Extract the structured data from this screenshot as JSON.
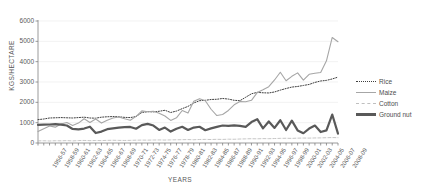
{
  "chart_data": {
    "type": "line",
    "title": "",
    "xlabel": "YEARS",
    "ylabel": "KGS/HECTARE",
    "ylim": [
      0,
      6000
    ],
    "yticks": [
      0,
      1000,
      2000,
      3000,
      4000,
      5000,
      6000
    ],
    "grid": true,
    "legend_position": "right",
    "x": [
      "1956-57",
      "1957-58",
      "1958-59",
      "1959-60",
      "1960-61",
      "1961-62",
      "1962-63",
      "1963-64",
      "1964-65",
      "1965-66",
      "1966-67",
      "1967-68",
      "1968-69",
      "1969-70",
      "1970-71",
      "1971-72",
      "1972-73",
      "1973-74",
      "1974-75",
      "1975-76",
      "1976-77",
      "1977-78",
      "1978-79",
      "1979-80",
      "1980-81",
      "1981-82",
      "1982-83",
      "1983-84",
      "1984-85",
      "1985-86",
      "1986-87",
      "1987-88",
      "1988-89",
      "1989-90",
      "1990-91",
      "1991-92",
      "1992-93",
      "1993-94",
      "1994-95",
      "1995-96",
      "1996-97",
      "1997-98",
      "1998-99",
      "1999-00",
      "2000-01",
      "2001-02",
      "2002-03",
      "2003-04",
      "2004-05",
      "2005-06",
      "2006-07",
      "2007-08",
      "2008-09"
    ],
    "xtick_labels": [
      "1956-57",
      "1958-59",
      "1960-61",
      "1962-63",
      "1964-65",
      "1966-67",
      "1968-69",
      "1970-71",
      "1972-73",
      "1974-75",
      "1976-77",
      "1978-79",
      "1980-81",
      "1982-83",
      "1984-85",
      "1986-87",
      "1988-89",
      "1990-91",
      "1992-93",
      "1994-95",
      "1996-97",
      "1998-99",
      "2000-01",
      "2002-03",
      "2004-05",
      "2006-07",
      "2008-09"
    ],
    "series": [
      {
        "name": "Rice",
        "style": "dotted",
        "color": "#3f3f3f",
        "width": 1,
        "values": [
          1150,
          1180,
          1230,
          1240,
          1250,
          1240,
          1230,
          1250,
          1270,
          1230,
          1220,
          1270,
          1290,
          1300,
          1290,
          1260,
          1250,
          1300,
          1500,
          1540,
          1530,
          1560,
          1610,
          1500,
          1570,
          1690,
          1800,
          1970,
          2080,
          2100,
          2140,
          2150,
          2190,
          2160,
          2100,
          2080,
          2250,
          2420,
          2490,
          2470,
          2460,
          2510,
          2600,
          2680,
          2750,
          2780,
          2830,
          2880,
          2980,
          3050,
          3080,
          3150,
          3240
        ]
      },
      {
        "name": "Maize",
        "style": "solid",
        "color": "#a6a6a6",
        "width": 1.1,
        "values": [
          560,
          700,
          840,
          780,
          930,
          1010,
          860,
          980,
          1190,
          1010,
          1180,
          980,
          1120,
          1230,
          1280,
          1190,
          1120,
          1310,
          1580,
          1540,
          1560,
          1460,
          1330,
          1110,
          1240,
          1600,
          1470,
          2050,
          2180,
          2080,
          1660,
          1350,
          1400,
          1600,
          1880,
          2040,
          2030,
          2100,
          2480,
          2620,
          2770,
          3100,
          3480,
          3060,
          3280,
          3450,
          3090,
          3380,
          3430,
          3470,
          4040,
          5190,
          4980
        ]
      },
      {
        "name": "Cotton",
        "style": "dashed",
        "color": "#bfbfbf",
        "width": 0.9,
        "values": [
          105,
          110,
          100,
          112,
          108,
          118,
          104,
          120,
          126,
          116,
          122,
          118,
          130,
          134,
          128,
          124,
          130,
          138,
          142,
          140,
          146,
          150,
          144,
          152,
          158,
          162,
          168,
          160,
          172,
          178,
          170,
          182,
          176,
          188,
          184,
          196,
          204,
          210,
          206,
          216,
          212,
          220,
          228,
          232,
          226,
          238,
          244,
          240,
          248,
          252,
          260,
          268,
          262
        ]
      },
      {
        "name": "Ground nut",
        "style": "solid",
        "color": "#595959",
        "width": 2.2,
        "values": [
          890,
          900,
          910,
          930,
          900,
          860,
          690,
          670,
          710,
          800,
          490,
          560,
          680,
          720,
          760,
          780,
          790,
          700,
          880,
          940,
          860,
          640,
          760,
          560,
          700,
          800,
          640,
          760,
          800,
          630,
          720,
          790,
          860,
          840,
          870,
          840,
          790,
          1030,
          1170,
          720,
          1060,
          740,
          1120,
          640,
          1100,
          620,
          480,
          710,
          860,
          540,
          620,
          1400,
          460
        ]
      }
    ]
  }
}
